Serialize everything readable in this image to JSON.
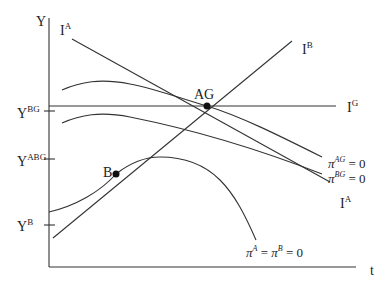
{
  "diagram": {
    "axes": {
      "y_label": "Y",
      "x_label": "t",
      "y_ticks": [
        {
          "base": "Y",
          "sup": "BG"
        },
        {
          "base": "Y",
          "sup": "ABG"
        },
        {
          "base": "Y",
          "sup": "B"
        }
      ]
    },
    "lines": {
      "ia_top": {
        "base": "I",
        "sup": "A"
      },
      "ia_bottom": {
        "base": "I",
        "sup": "A"
      },
      "ib": {
        "base": "I",
        "sup": "B"
      },
      "ig": {
        "base": "I",
        "sup": "G"
      }
    },
    "curves": {
      "pi_ag": {
        "base": "π",
        "sup": "AG",
        "rest": " = 0"
      },
      "pi_bg": {
        "base": "π",
        "sup": "BG",
        "rest": " = 0"
      },
      "pi_ab": {
        "base1": "π",
        "sup1": "A",
        "mid": " = ",
        "base2": "π",
        "sup2": "B",
        "rest": " = 0"
      }
    },
    "points": {
      "ag": "AG",
      "b": "B"
    }
  }
}
